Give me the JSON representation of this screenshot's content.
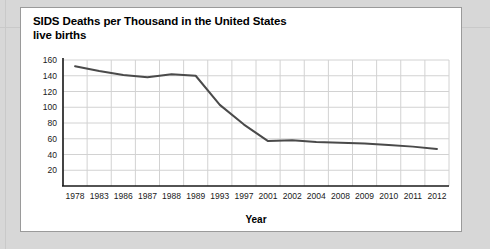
{
  "panel": {
    "title_line1": "SIDS Deaths per Thousand in the United States",
    "title_line2": "live births"
  },
  "chart_data": {
    "type": "line",
    "title": "SIDS Deaths per Thousand in the United States live births",
    "xlabel": "Year",
    "ylabel": "",
    "categories": [
      "1978",
      "1983",
      "1986",
      "1987",
      "1988",
      "1989",
      "1993",
      "1997",
      "2001",
      "2002",
      "2004",
      "2008",
      "2009",
      "2010",
      "2011",
      "2012"
    ],
    "values": [
      152,
      146,
      141,
      138,
      142,
      140,
      103,
      78,
      57,
      58,
      56,
      55,
      54,
      52,
      50,
      47
    ],
    "series": [
      {
        "name": "SIDS deaths per thousand live births",
        "values": [
          152,
          146,
          141,
          138,
          142,
          140,
          103,
          78,
          57,
          58,
          56,
          55,
          54,
          52,
          50,
          47
        ]
      }
    ],
    "yticks": [
      20,
      40,
      60,
      80,
      100,
      120,
      140,
      160
    ],
    "ylim": [
      0,
      160
    ],
    "grid": true,
    "legend": false,
    "line_color": "#4a4a4a"
  }
}
